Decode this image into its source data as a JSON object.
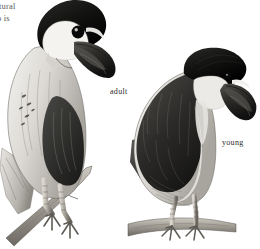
{
  "page": {
    "background_color": "#ffffff",
    "medium": "graphite / ink field-guide plate",
    "palette": {
      "paper": "#ffffff",
      "ink_black": "#141414",
      "cap_black": "#1b1b1b",
      "wing_dark": "#2e2e2e",
      "mid_grey": "#8c8c8c",
      "pale_grey": "#d8d6d2",
      "highlight": "#f2f1ee",
      "branch": "#9a958c",
      "text_grey": "#4a4a4a"
    }
  },
  "bleed_text": {
    "line_1": "tural",
    "line_2": "o is"
  },
  "captions": {
    "adult": "adult",
    "young": "young"
  },
  "illustration": {
    "subject": "Boat-billed Heron",
    "figure_count": 2,
    "figures": [
      {
        "id": "adult-bird",
        "label": "adult",
        "pose": "perched on diagonal branch, body angled left, head turned right",
        "crown": "glossy black cap extending over nape",
        "face": "white cheek and throat",
        "eye": "large black eye with pale crescent behind",
        "bill": "very broad deep boat-shaped dark bill",
        "body": "pale grey breast and flanks with fine streaking",
        "wing": "grey with dark scapular patch",
        "legs": "two scaled legs gripping a diagonal branch",
        "bbox": [
          0,
          0,
          118,
          230
        ]
      },
      {
        "id": "young-bird",
        "label": "young",
        "pose": "standing upright on horizontal branch, facing right",
        "crown": "dark brown-black cap",
        "face": "pale buff cheek and throat",
        "eye": "dark eye set high near bill base",
        "bill": "broad dark boat-shaped bill, paler base",
        "body": "pale buff underparts",
        "wing": "dark brown-black wing with scaled feather edges",
        "legs": "two long scaled legs standing on horizontal branch",
        "bbox": [
          132,
          48,
          128,
          240
        ]
      }
    ],
    "perches": [
      {
        "id": "branch-left",
        "orientation": "diagonal",
        "figure": "adult-bird"
      },
      {
        "id": "branch-right",
        "orientation": "horizontal",
        "figure": "young-bird"
      }
    ]
  }
}
